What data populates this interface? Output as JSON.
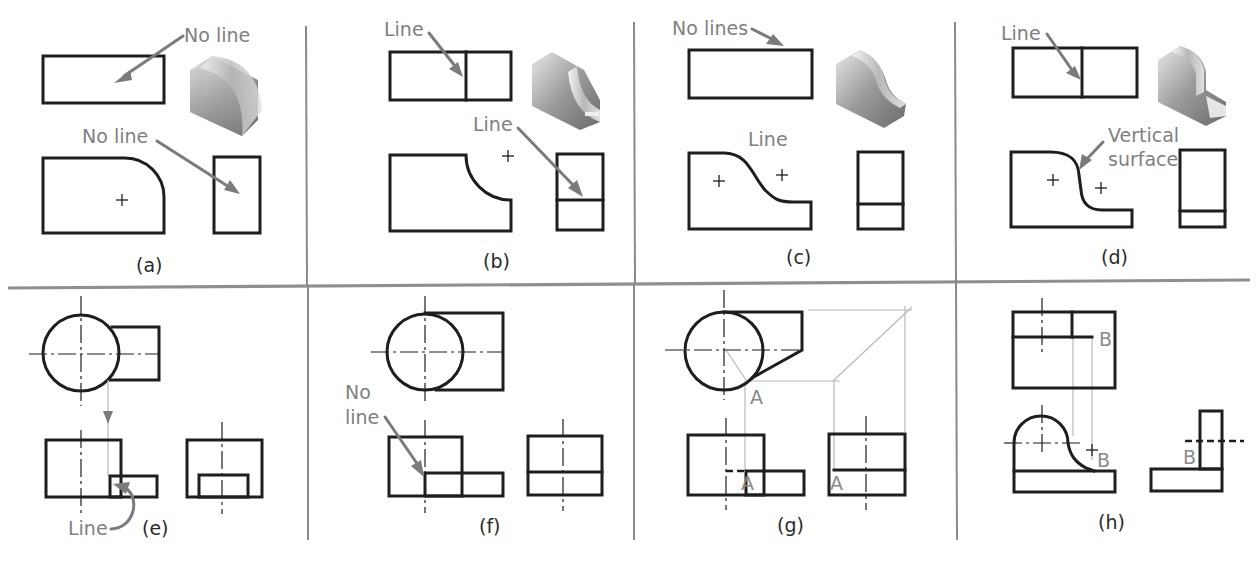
{
  "figure": {
    "panels": [
      {
        "id": "a",
        "caption": "(a)",
        "notes": [
          "No line",
          "No line"
        ]
      },
      {
        "id": "b",
        "caption": "(b)",
        "notes": [
          "Line",
          "Line"
        ]
      },
      {
        "id": "c",
        "caption": "(c)",
        "notes": [
          "No lines",
          "Line"
        ]
      },
      {
        "id": "d",
        "caption": "(d)",
        "notes": [
          "Line",
          "Vertical",
          "surface"
        ]
      },
      {
        "id": "e",
        "caption": "(e)",
        "notes": [
          "Line"
        ]
      },
      {
        "id": "f",
        "caption": "(f)",
        "notes": [
          "No",
          "line"
        ]
      },
      {
        "id": "g",
        "caption": "(g)",
        "notes": [],
        "point_labels": [
          "A",
          "A",
          "A"
        ]
      },
      {
        "id": "h",
        "caption": "(h)",
        "notes": [],
        "point_labels": [
          "B",
          "B",
          "B"
        ]
      }
    ]
  },
  "colors": {
    "object_line": "#1e1e1e",
    "annotation": "#7b7b7b",
    "projection_line": "#b9b9b9",
    "divider": "#8a8a8a",
    "background": "#ffffff"
  }
}
